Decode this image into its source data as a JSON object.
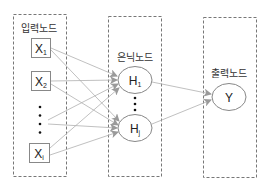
{
  "diagram": {
    "type": "neural-network",
    "colors": {
      "box_border": "#777777",
      "node_border": "#888888",
      "arrow": "#aaaaaa",
      "text": "#333333",
      "dots": "#111111"
    },
    "layers": [
      {
        "id": "input",
        "title": "입력노드",
        "nodes": [
          {
            "id": "x1",
            "base": "X",
            "sub": "1",
            "shape": "square"
          },
          {
            "id": "x2",
            "base": "X",
            "sub": "2",
            "shape": "square"
          },
          {
            "id": "ellipsis",
            "base": "⋮",
            "shape": "dots"
          },
          {
            "id": "xi",
            "base": "X",
            "sub": "i",
            "shape": "square"
          }
        ]
      },
      {
        "id": "hidden",
        "title": "은닉노드",
        "nodes": [
          {
            "id": "h1",
            "base": "H",
            "sub": "1",
            "shape": "ellipse"
          },
          {
            "id": "ellipsis",
            "base": "⋮",
            "shape": "dots"
          },
          {
            "id": "hj",
            "base": "H",
            "sub": "j",
            "shape": "ellipse"
          }
        ]
      },
      {
        "id": "output",
        "title": "출력노드",
        "nodes": [
          {
            "id": "y",
            "base": "Y",
            "shape": "ellipse"
          }
        ]
      }
    ],
    "edges": [
      [
        "x1",
        "h1"
      ],
      [
        "x1",
        "hj"
      ],
      [
        "x2",
        "h1"
      ],
      [
        "x2",
        "hj"
      ],
      [
        "ellipsis",
        "h1"
      ],
      [
        "ellipsis",
        "hj"
      ],
      [
        "xi",
        "h1"
      ],
      [
        "xi",
        "hj"
      ],
      [
        "h1",
        "y"
      ],
      [
        "hj",
        "y"
      ]
    ]
  }
}
